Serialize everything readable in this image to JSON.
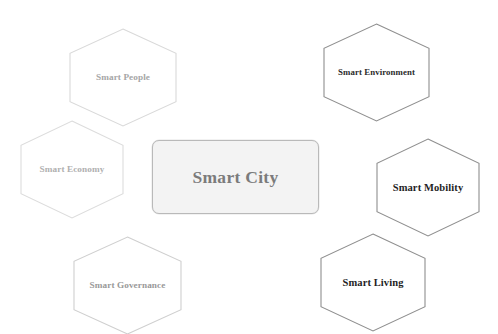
{
  "diagram": {
    "type": "hub-and-spoke hexagon diagram",
    "background_color": "#ffffff",
    "center": {
      "label": "Smart City",
      "shape": "rounded-rectangle",
      "fill_color": "#f3f3f3",
      "stroke_color": "#b9b9b9",
      "text_color": "#7b7b7b",
      "font_size_px": 17.5
    },
    "nodes": [
      {
        "id": "smart-people",
        "label": "Smart People",
        "shape": "hexagon",
        "position": "top-left",
        "x": 70,
        "y": 29,
        "width": 106,
        "height": 97,
        "stroke_color": "#d9d9d9",
        "text_color": "#a6a6a6",
        "font_size_px": 9.2
      },
      {
        "id": "smart-economy",
        "label": "Smart Economy",
        "shape": "hexagon",
        "position": "left",
        "x": 21,
        "y": 121,
        "width": 102,
        "height": 97,
        "stroke_color": "#dcdcdc",
        "text_color": "#b0b0b0",
        "font_size_px": 9.2
      },
      {
        "id": "smart-governance",
        "label": "Smart Governance",
        "shape": "hexagon",
        "position": "bottom-left",
        "x": 74,
        "y": 237,
        "width": 107,
        "height": 97,
        "stroke_color": "#cfcfcf",
        "text_color": "#999999",
        "font_size_px": 9.2
      },
      {
        "id": "smart-environment",
        "label": "Smart Environment",
        "shape": "hexagon",
        "position": "top-right",
        "x": 324,
        "y": 24,
        "width": 105,
        "height": 97,
        "stroke_color": "#8f8f8f",
        "text_color": "#2b2b2b",
        "font_size_px": 8.8
      },
      {
        "id": "smart-mobility",
        "label": "Smart Mobility",
        "shape": "hexagon",
        "position": "right",
        "x": 377,
        "y": 139,
        "width": 102,
        "height": 97,
        "stroke_color": "#8f8f8f",
        "text_color": "#1f1f1f",
        "font_size_px": 10.5
      },
      {
        "id": "smart-living",
        "label": "Smart Living",
        "shape": "hexagon",
        "position": "bottom-right",
        "x": 321,
        "y": 234,
        "width": 104,
        "height": 97,
        "stroke_color": "#8f8f8f",
        "text_color": "#1f1f1f",
        "font_size_px": 10.5
      }
    ]
  }
}
